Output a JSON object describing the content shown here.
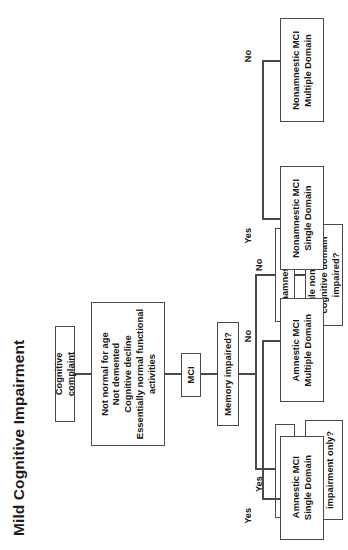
{
  "figure": {
    "title": "Mild Cognitive Impairment",
    "orientation": "rotated-90-ccw",
    "nodes": {
      "complaint": "Cognitive complaint",
      "criteria": "Not normal for age\nNot demented\nCognitive decline\nEssentially normal functional activities",
      "mci": "MCI",
      "memory_impaired": "Memory impaired?",
      "nonamnestic": "Nonamnestic MCI",
      "single_nonmemory": "Single nonmemory\ncognitive domain\nimpaired?",
      "nonamnestic_multiple": "Nonamnestic MCI\nMultiple Domain",
      "nonamnestic_single": "Nonamnestic MCI\nSingle Domain",
      "amnestic": "Amnestic MCI",
      "memory_only": "Memory\nimpairment only?",
      "amnestic_multiple": "Amnestic MCI\nMultiple Domain",
      "amnestic_single": "Amnestic MCI\nSingle Domain"
    },
    "edge_labels": {
      "memory_no": "No",
      "memory_yes": "Yes",
      "nonmemory_no": "No",
      "nonmemory_yes": "Yes",
      "memonly_no": "No",
      "memonly_yes": "Yes"
    },
    "colors": {
      "border": "#4a4a4a",
      "text": "#161616",
      "background": "#ffffff"
    }
  }
}
